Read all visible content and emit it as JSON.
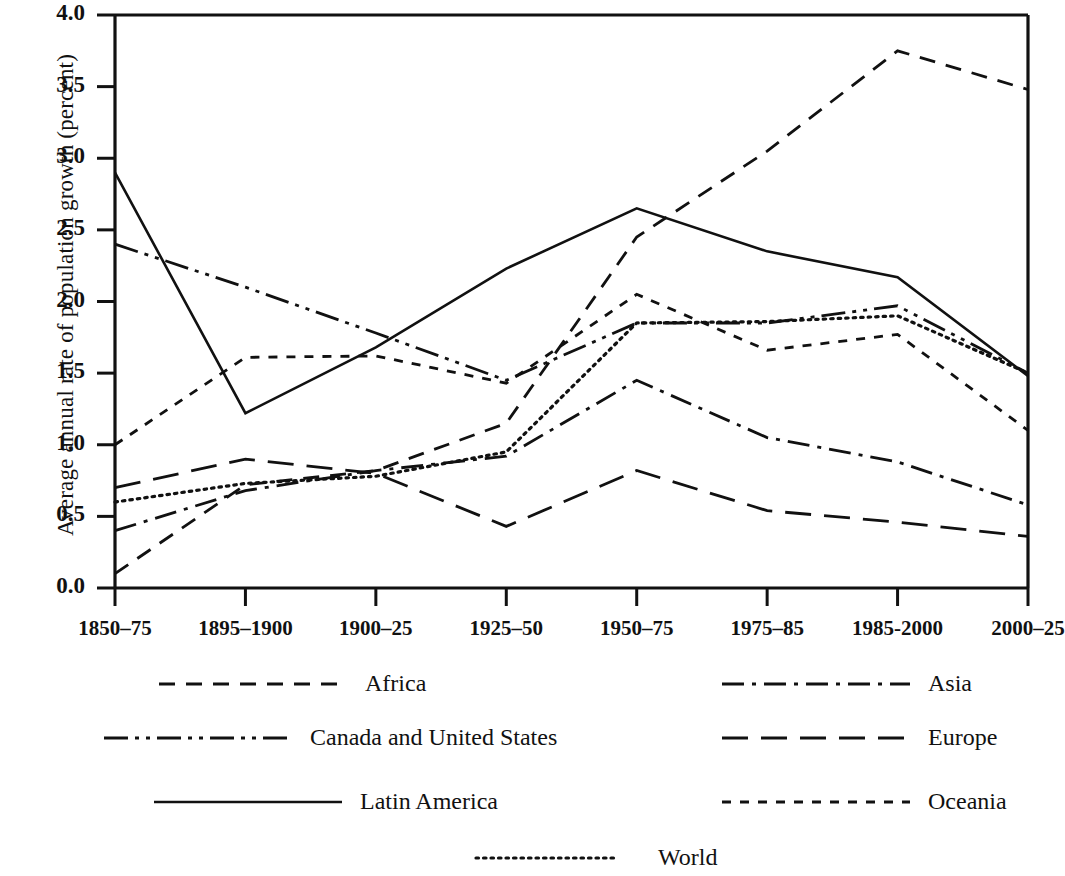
{
  "chart_data": {
    "type": "line",
    "title": "",
    "xlabel": "",
    "ylabel": "Average annual rate of population growth (percent)",
    "categories": [
      "1850–75",
      "1895–1900",
      "1900–25",
      "1925–50",
      "1950–75",
      "1975–85",
      "1985-2000",
      "2000–25"
    ],
    "ylim": [
      0.0,
      4.0
    ],
    "ytick_labels": [
      "0.0",
      "0.5",
      "1.0",
      "1.5",
      "2.0",
      "2.5",
      "3.0",
      "3.5",
      "4.0"
    ],
    "ytick_values": [
      0.0,
      0.5,
      1.0,
      1.5,
      2.0,
      2.5,
      3.0,
      3.5,
      4.0
    ],
    "grid": false,
    "legend_position": "below",
    "series": [
      {
        "name": "Africa",
        "style": "dashed",
        "values": [
          0.1,
          0.72,
          0.82,
          1.15,
          2.45,
          3.05,
          3.75,
          3.48
        ]
      },
      {
        "name": "Asia",
        "style": "dash-dot",
        "values": [
          0.4,
          0.68,
          0.82,
          0.92,
          1.45,
          1.05,
          0.88,
          0.58
        ]
      },
      {
        "name": "Canada and United States",
        "style": "dash-dot-dot",
        "values": [
          2.4,
          2.1,
          1.78,
          1.45,
          1.85,
          1.85,
          1.97,
          1.5
        ]
      },
      {
        "name": "Europe",
        "style": "long-dash",
        "values": [
          0.7,
          0.9,
          0.8,
          0.43,
          0.82,
          0.54,
          0.46,
          0.36
        ]
      },
      {
        "name": "Latin America",
        "style": "solid",
        "values": [
          2.9,
          1.22,
          1.68,
          2.23,
          2.65,
          2.35,
          2.17,
          1.48
        ]
      },
      {
        "name": "Oceania",
        "style": "short-dash",
        "values": [
          1.0,
          1.61,
          1.62,
          1.43,
          2.05,
          1.66,
          1.77,
          1.1
        ]
      },
      {
        "name": "World",
        "style": "dotted",
        "values": [
          0.6,
          0.73,
          0.78,
          0.95,
          1.85,
          1.86,
          1.9,
          1.5
        ]
      }
    ]
  },
  "legend": {
    "items": [
      {
        "label": "Africa",
        "style": "dashed"
      },
      {
        "label": "Asia",
        "style": "dash-dot"
      },
      {
        "label": "Canada and United States",
        "style": "dash-dot-dot"
      },
      {
        "label": "Europe",
        "style": "long-dash"
      },
      {
        "label": "Latin America",
        "style": "solid"
      },
      {
        "label": "Oceania",
        "style": "short-dash"
      },
      {
        "label": "World",
        "style": "dotted"
      }
    ]
  },
  "colors": {
    "ink": "#111111",
    "background": "#ffffff"
  }
}
